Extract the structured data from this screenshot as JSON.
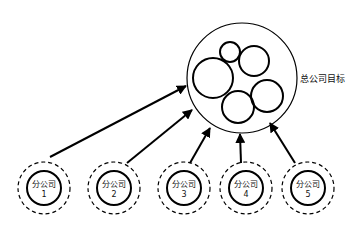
{
  "diagram": {
    "type": "goal-alignment",
    "parent": {
      "label": "总公司目标",
      "inner_circle_count": 5
    },
    "children": [
      {
        "line1": "分公司",
        "line2": "1"
      },
      {
        "line1": "分公司",
        "line2": "2"
      },
      {
        "line1": "分公司",
        "line2": "3"
      },
      {
        "line1": "分公司",
        "line2": "4"
      },
      {
        "line1": "分公司",
        "line2": "5"
      }
    ],
    "edges": [
      {
        "from": "分公司1",
        "to": "总公司目标"
      },
      {
        "from": "分公司2",
        "to": "总公司目标"
      },
      {
        "from": "分公司3",
        "to": "总公司目标"
      },
      {
        "from": "分公司4",
        "to": "总公司目标"
      },
      {
        "from": "分公司5",
        "to": "总公司目标"
      }
    ]
  }
}
